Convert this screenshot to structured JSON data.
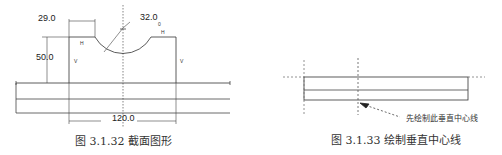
{
  "figure_left": {
    "caption": "图 3.1.32  截面图形",
    "dimensions": {
      "width_top_left": "29.0",
      "radius": "32.0",
      "height": "50.0",
      "total_width": "120.0"
    },
    "constraint_marks": {
      "h": "H",
      "v": "V",
      "r_sub": "0"
    }
  },
  "figure_right": {
    "caption": "图 3.1.33  绘制垂直中心线",
    "annotation": "先绘制此垂直中心线"
  }
}
